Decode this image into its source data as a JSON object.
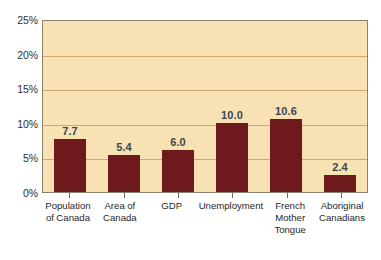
{
  "chart_data": {
    "type": "bar",
    "title": "",
    "subtitle": "",
    "xlabel": "",
    "ylabel": "",
    "categories": [
      "Population of Canada",
      "Area of Canada",
      "GDP",
      "Unemployment",
      "French Mother Tongue",
      "Aboriginal Canadians"
    ],
    "category_lines": [
      [
        "Population",
        "of Canada"
      ],
      [
        "Area of",
        "Canada"
      ],
      [
        "GDP"
      ],
      [
        "Unemployment"
      ],
      [
        "French",
        "Mother",
        "Tongue"
      ],
      [
        "Aboriginal",
        "Canadians"
      ]
    ],
    "values": [
      7.7,
      5.4,
      6.0,
      10.0,
      10.6,
      2.4
    ],
    "value_labels": [
      "7.7",
      "5.4",
      "6.0",
      "10.0",
      "10.6",
      "2.4"
    ],
    "ylim": [
      0,
      25
    ],
    "y_ticks": [
      0,
      5,
      10,
      15,
      20,
      25
    ],
    "y_tick_labels": [
      "0%",
      "5%",
      "10%",
      "15%",
      "20%",
      "25%"
    ],
    "grid": true,
    "grid_axis": "y",
    "legend": false,
    "legend_position": "none",
    "units": "percent",
    "colors": {
      "bar": "#6e1a1c",
      "plot_background": "#f8e2b4",
      "figure_background": "#ffffff",
      "gridline": "#cbab74",
      "axis_frame": "#8a8070",
      "value_label_text": "#3b4450",
      "tick_label_text": "#2f2f33",
      "category_label_text": "#26262a"
    }
  }
}
